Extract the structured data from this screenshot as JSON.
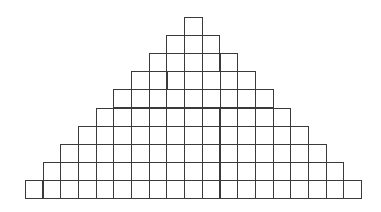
{
  "diagram": {
    "type": "staircase-pyramid-grid",
    "rows": 10,
    "cells_per_row": [
      1,
      3,
      5,
      7,
      9,
      11,
      13,
      15,
      17,
      19
    ],
    "cell_size_px": 17.7,
    "origin": {
      "center_x": 193,
      "top_y": 17
    },
    "line_color": "#3a3a3a",
    "fill_color": "#ffffff"
  }
}
